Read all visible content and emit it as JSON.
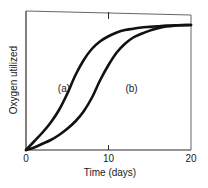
{
  "chart_data": {
    "type": "line",
    "title": "",
    "xlabel": "Time (days)",
    "ylabel": "Oxygen utilized",
    "xlim": [
      0,
      20
    ],
    "ylim": [
      0,
      100
    ],
    "x_ticks": [
      0,
      10,
      20
    ],
    "x_tick_labels": [
      "0",
      "10",
      "20"
    ],
    "y_ticks": [],
    "grid": false,
    "legend": "none (curves labeled inline)",
    "x": [
      0,
      1,
      2,
      3,
      4,
      5,
      6,
      7,
      8,
      9,
      10,
      11,
      12,
      13,
      14,
      15,
      16,
      17,
      18,
      19,
      20
    ],
    "series": [
      {
        "name": "(a)",
        "values": [
          0,
          7,
          14,
          22,
          32,
          45,
          60,
          72,
          81,
          87,
          91,
          94,
          96,
          97,
          98,
          98.5,
          99,
          99.5,
          99.7,
          99.9,
          100
        ]
      },
      {
        "name": "(b)",
        "values": [
          0,
          2,
          5,
          8,
          12,
          17,
          23,
          31,
          42,
          56,
          68,
          78,
          85,
          90,
          93,
          95.5,
          97.5,
          98.8,
          99.5,
          99.8,
          100
        ]
      }
    ],
    "annotations": [
      {
        "text": "(a)",
        "x": 4.6,
        "y": 50
      },
      {
        "text": "(b)",
        "x": 12.8,
        "y": 50
      }
    ]
  }
}
